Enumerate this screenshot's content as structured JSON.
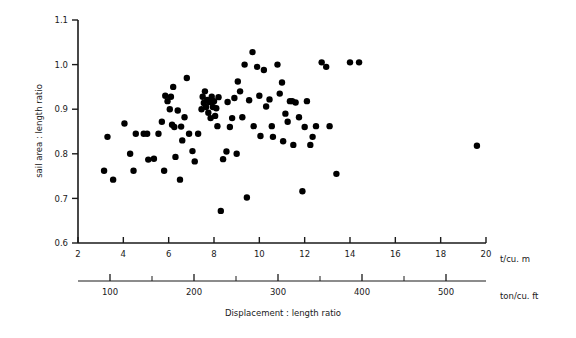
{
  "chart_data": {
    "type": "scatter",
    "title": "",
    "xlabel": "Displacement : length ratio",
    "ylabel": "sail area : length ratio",
    "x_unit_primary": "t/cu. m",
    "x_unit_secondary": "ton/cu. ft",
    "xlim": [
      2,
      20
    ],
    "ylim": [
      0.6,
      1.1
    ],
    "x_ticks": [
      2,
      4,
      6,
      8,
      10,
      12,
      14,
      16,
      18,
      20
    ],
    "x_tick_labels": [
      "2",
      "4",
      "6",
      "8",
      "10",
      "12",
      "14",
      "16",
      "18",
      "20"
    ],
    "y_ticks": [
      0.6,
      0.7,
      0.8,
      0.9,
      1.0,
      1.1
    ],
    "y_tick_labels": [
      "0.6",
      "0.7",
      "0.8",
      "0.9",
      "1.0",
      "1.1"
    ],
    "x_ticks_secondary": [
      100,
      150,
      200,
      250,
      300,
      350,
      400,
      450,
      500
    ],
    "x_tick_labels_secondary": [
      "100",
      "",
      "200",
      "",
      "300",
      "",
      "400",
      "",
      "500"
    ],
    "grid": false,
    "legend": "none",
    "marker": "filled-circle",
    "marker_color": "#000000",
    "marker_size_px": 4.2,
    "n_points": 99,
    "points": [
      [
        3.15,
        0.762
      ],
      [
        3.3,
        0.838
      ],
      [
        3.55,
        0.742
      ],
      [
        4.05,
        0.868
      ],
      [
        4.3,
        0.8
      ],
      [
        4.45,
        0.762
      ],
      [
        4.55,
        0.845
      ],
      [
        4.9,
        0.845
      ],
      [
        5.05,
        0.845
      ],
      [
        5.1,
        0.787
      ],
      [
        5.35,
        0.789
      ],
      [
        5.55,
        0.845
      ],
      [
        5.7,
        0.872
      ],
      [
        5.8,
        0.762
      ],
      [
        5.85,
        0.93
      ],
      [
        5.95,
        0.918
      ],
      [
        6.05,
        0.9
      ],
      [
        6.1,
        0.928
      ],
      [
        6.15,
        0.865
      ],
      [
        6.2,
        0.95
      ],
      [
        6.25,
        0.86
      ],
      [
        6.3,
        0.793
      ],
      [
        6.4,
        0.897
      ],
      [
        6.5,
        0.742
      ],
      [
        6.55,
        0.861
      ],
      [
        6.6,
        0.83
      ],
      [
        6.7,
        0.882
      ],
      [
        6.8,
        0.97
      ],
      [
        6.9,
        0.845
      ],
      [
        7.05,
        0.806
      ],
      [
        7.15,
        0.783
      ],
      [
        7.3,
        0.845
      ],
      [
        7.45,
        0.9
      ],
      [
        7.5,
        0.928
      ],
      [
        7.55,
        0.914
      ],
      [
        7.6,
        0.94
      ],
      [
        7.65,
        0.905
      ],
      [
        7.7,
        0.921
      ],
      [
        7.75,
        0.892
      ],
      [
        7.8,
        0.916
      ],
      [
        7.85,
        0.88
      ],
      [
        7.9,
        0.928
      ],
      [
        7.95,
        0.905
      ],
      [
        8.0,
        0.918
      ],
      [
        8.05,
        0.885
      ],
      [
        8.1,
        0.902
      ],
      [
        8.15,
        0.862
      ],
      [
        8.2,
        0.927
      ],
      [
        8.3,
        0.672
      ],
      [
        8.4,
        0.788
      ],
      [
        8.55,
        0.805
      ],
      [
        8.6,
        0.916
      ],
      [
        8.7,
        0.86
      ],
      [
        8.8,
        0.88
      ],
      [
        8.9,
        0.925
      ],
      [
        9.0,
        0.8
      ],
      [
        9.05,
        0.962
      ],
      [
        9.15,
        0.94
      ],
      [
        9.25,
        0.882
      ],
      [
        9.35,
        1.0
      ],
      [
        9.45,
        0.702
      ],
      [
        9.55,
        0.92
      ],
      [
        9.7,
        1.028
      ],
      [
        9.75,
        0.862
      ],
      [
        9.9,
        0.995
      ],
      [
        10.0,
        0.93
      ],
      [
        10.05,
        0.84
      ],
      [
        10.2,
        0.988
      ],
      [
        10.3,
        0.906
      ],
      [
        10.45,
        0.922
      ],
      [
        10.55,
        0.862
      ],
      [
        10.6,
        0.838
      ],
      [
        10.8,
        1.0
      ],
      [
        10.9,
        0.935
      ],
      [
        11.0,
        0.96
      ],
      [
        11.05,
        0.828
      ],
      [
        11.15,
        0.89
      ],
      [
        11.25,
        0.872
      ],
      [
        11.35,
        0.918
      ],
      [
        11.45,
        0.918
      ],
      [
        11.5,
        0.82
      ],
      [
        11.6,
        0.915
      ],
      [
        11.75,
        0.882
      ],
      [
        11.9,
        0.716
      ],
      [
        12.0,
        0.86
      ],
      [
        12.1,
        0.918
      ],
      [
        12.25,
        0.82
      ],
      [
        12.35,
        0.838
      ],
      [
        12.5,
        0.862
      ],
      [
        12.75,
        1.005
      ],
      [
        12.95,
        0.995
      ],
      [
        13.1,
        0.862
      ],
      [
        13.4,
        0.755
      ],
      [
        14.0,
        1.005
      ],
      [
        14.4,
        1.005
      ],
      [
        19.6,
        0.818
      ]
    ]
  },
  "axes": {
    "y_axis_title": "sail area : length ratio",
    "x_axis_title": "Displacement : length ratio",
    "primary_unit_label": "t/cu. m",
    "secondary_unit_label": "ton/cu. ft"
  }
}
